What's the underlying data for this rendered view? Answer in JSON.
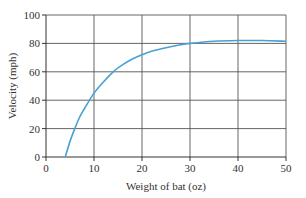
{
  "chart_data": {
    "type": "line",
    "title": "",
    "xlabel": "Weight of bat (oz)",
    "ylabel": "Velocity (mph)",
    "xlim": [
      0,
      50
    ],
    "ylim": [
      0,
      100
    ],
    "x_ticks": [
      0,
      10,
      20,
      30,
      40,
      50
    ],
    "y_ticks": [
      0,
      20,
      40,
      60,
      80,
      100
    ],
    "grid": true,
    "legend": null,
    "series": [
      {
        "name": "Velocity",
        "color": "#4a9fd4",
        "x": [
          4,
          5,
          6,
          7,
          8,
          10,
          12,
          14,
          16,
          18,
          20,
          22,
          25,
          28,
          30,
          35,
          40,
          45,
          50
        ],
        "y": [
          0,
          11,
          20,
          28,
          34,
          45,
          53,
          60,
          65,
          69,
          72,
          74.5,
          77,
          79,
          80,
          81.5,
          82,
          82,
          81.5
        ]
      }
    ]
  }
}
